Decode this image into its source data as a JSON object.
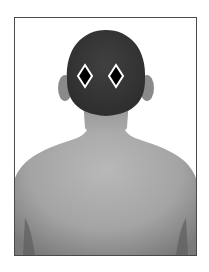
{
  "figure": {
    "markers": [
      {
        "shape": "diamond",
        "fill": "#000000",
        "stroke": "#ffffff"
      },
      {
        "shape": "diamond",
        "fill": "#000000",
        "stroke": "#ffffff"
      }
    ],
    "colors": {
      "frame_border": "#4a4a4a",
      "hair": "#3a3a3a",
      "skin": "#a8a8a8",
      "background": "#ffffff"
    }
  }
}
